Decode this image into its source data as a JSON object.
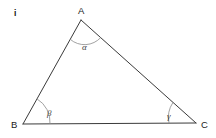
{
  "figure": {
    "index_label": "i",
    "type": "triangle-diagram",
    "background_color": "#ffffff",
    "stroke_color": "#3a3a3a",
    "arc_color": "#8a8a8a",
    "label_color": "#1a1a1a",
    "vertices": [
      {
        "name": "A",
        "label": "A",
        "x": 81,
        "y": 20,
        "label_x": 78,
        "label_y": 14
      },
      {
        "name": "B",
        "label": "B",
        "x": 23,
        "y": 124,
        "label_x": 11,
        "label_y": 124
      },
      {
        "name": "C",
        "label": "C",
        "x": 196,
        "y": 123,
        "label_x": 201,
        "label_y": 126
      }
    ],
    "angles": [
      {
        "at": "A",
        "symbol": "α",
        "name": "alpha",
        "label_x": 82,
        "label_y": 50
      },
      {
        "at": "B",
        "symbol": "β",
        "name": "beta",
        "label_x": 47,
        "label_y": 116
      },
      {
        "at": "C",
        "symbol": "γ",
        "name": "gamma",
        "label_x": 167,
        "label_y": 119
      }
    ],
    "sides": [
      {
        "name": "AB",
        "from": "A",
        "to": "B"
      },
      {
        "name": "AC",
        "from": "A",
        "to": "C"
      },
      {
        "name": "BC",
        "from": "B",
        "to": "C"
      }
    ]
  }
}
